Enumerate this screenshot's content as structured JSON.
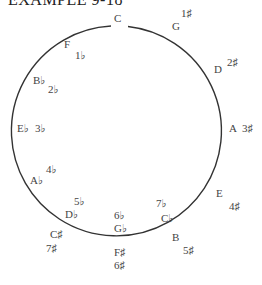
{
  "title": "EXAMPLE 9-18",
  "diagram": {
    "type": "circle-of-fifths",
    "stroke_color": "#333333",
    "keys": [
      {
        "note": "C",
        "note_x": 114,
        "note_y": 18,
        "sig": "",
        "sig_x": 0,
        "sig_y": 0
      },
      {
        "note": "G",
        "note_x": 172,
        "note_y": 26,
        "sig": "1♯",
        "sig_x": 181,
        "sig_y": 13
      },
      {
        "note": "D",
        "note_x": 214,
        "note_y": 69,
        "sig": "2♯",
        "sig_x": 227,
        "sig_y": 62
      },
      {
        "note": "A",
        "note_x": 229,
        "note_y": 128,
        "sig": "3♯",
        "sig_x": 242,
        "sig_y": 128
      },
      {
        "note": "E",
        "note_x": 216,
        "note_y": 193,
        "sig": "4♯",
        "sig_x": 229,
        "sig_y": 206
      },
      {
        "note": "B",
        "note_x": 172,
        "note_y": 237,
        "sig": "5♯",
        "sig_x": 183,
        "sig_y": 250
      },
      {
        "note": "F♯",
        "note_x": 114,
        "note_y": 252,
        "sig": "6♯",
        "sig_x": 114,
        "sig_y": 265
      },
      {
        "note": "C♯",
        "note_x": 50,
        "note_y": 234,
        "sig": "7♯",
        "sig_x": 46,
        "sig_y": 248
      },
      {
        "note": "G♭",
        "note_x": 114,
        "note_y": 228,
        "sig": "6♭",
        "sig_x": 114,
        "sig_y": 215
      },
      {
        "note": "C♭",
        "note_x": 161,
        "note_y": 218,
        "sig": "7♭",
        "sig_x": 156,
        "sig_y": 203
      },
      {
        "note": "D♭",
        "note_x": 65,
        "note_y": 214,
        "sig": "5♭",
        "sig_x": 74,
        "sig_y": 201
      },
      {
        "note": "A♭",
        "note_x": 30,
        "note_y": 180,
        "sig": "4♭",
        "sig_x": 46,
        "sig_y": 169
      },
      {
        "note": "E♭",
        "note_x": 17,
        "note_y": 128,
        "sig": "3♭",
        "sig_x": 35,
        "sig_y": 128
      },
      {
        "note": "B♭",
        "note_x": 33,
        "note_y": 80,
        "sig": "2♭",
        "sig_x": 48,
        "sig_y": 89
      },
      {
        "note": "F",
        "note_x": 64,
        "note_y": 44,
        "sig": "1♭",
        "sig_x": 75,
        "sig_y": 55
      }
    ]
  }
}
